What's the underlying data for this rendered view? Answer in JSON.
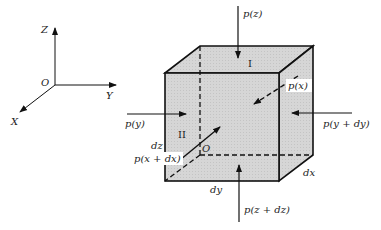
{
  "axes": {
    "z_label": "Z",
    "y_label": "Y",
    "x_label": "X",
    "origin_label": "O"
  },
  "cube": {
    "face_top_label": "I",
    "face_left_label": "II",
    "origin_label": "O",
    "dim_dz": "dz",
    "dim_dy": "dy",
    "dim_dx": "dx",
    "face_color": "#d9d9d9"
  },
  "forces": {
    "p_z": "p(z)",
    "p_z_dz": "p(z + dz)",
    "p_y": "p(y)",
    "p_y_dy": "p(y + dy)",
    "p_x": "p(x)",
    "p_x_dx": "p(x + dx)"
  }
}
